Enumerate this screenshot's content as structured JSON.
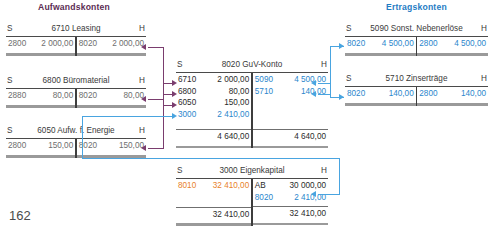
{
  "page": {
    "number": "162"
  },
  "headings": {
    "expenses": "Aufwandskonten",
    "revenues": "Ertragskonten",
    "color_expenses": "#5b2c53",
    "color_revenues": "#1f7cc4"
  },
  "labels": {
    "debit": "S",
    "credit": "H"
  },
  "accounts": {
    "leasing": {
      "title": "6710 Leasing",
      "debit": [
        {
          "key": "2800",
          "value": "2 000,00"
        }
      ],
      "credit": [
        {
          "key": "8020",
          "value": "2 000,00"
        }
      ]
    },
    "bueromaterial": {
      "title": "6800 Büromaterial",
      "debit": [
        {
          "key": "2880",
          "value": "80,00"
        }
      ],
      "credit": [
        {
          "key": "8020",
          "value": "80,00"
        }
      ]
    },
    "energie": {
      "title": "6050 Aufw. f. Energie",
      "debit": [
        {
          "key": "2800",
          "value": "150,00"
        }
      ],
      "credit": [
        {
          "key": "8020",
          "value": "150,00"
        }
      ]
    },
    "guv": {
      "title": "8020 GuV-Konto",
      "debit": [
        {
          "key": "6710",
          "value": "2 000,00"
        },
        {
          "key": "6800",
          "value": "80,00"
        },
        {
          "key": "6050",
          "value": "150,00"
        },
        {
          "key": "3000",
          "value": "2 410,00"
        }
      ],
      "credit": [
        {
          "key": "5090",
          "value": "4 500,00"
        },
        {
          "key": "5710",
          "value": "140,00"
        }
      ],
      "total_debit": "4 640,00",
      "total_credit": "4 640,00"
    },
    "nebenerloese": {
      "title": "5090 Sonst. Nebenerlöse",
      "debit": [
        {
          "key": "8020",
          "value": "4 500,00"
        }
      ],
      "credit": [
        {
          "key": "2800",
          "value": "4 500,00"
        }
      ]
    },
    "zinsertraege": {
      "title": "5710 Zinserträge",
      "debit": [
        {
          "key": "8020",
          "value": "140,00"
        }
      ],
      "credit": [
        {
          "key": "2800",
          "value": "140,00"
        }
      ]
    },
    "eigenkapital": {
      "title": "3000 Eigenkapital",
      "debit": [
        {
          "key": "8010",
          "value": "32 410,00"
        }
      ],
      "credit": [
        {
          "key": "AB",
          "value": "30 000,00"
        },
        {
          "key": "8020",
          "value": "2 410,00"
        }
      ],
      "total_debit": "32 410,00",
      "total_credit": "32 410,00"
    }
  }
}
